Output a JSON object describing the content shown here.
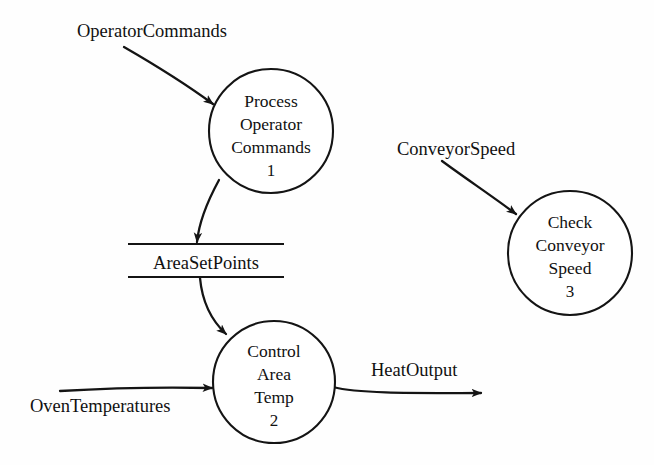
{
  "diagram": {
    "type": "data-flow-diagram",
    "title": "",
    "background_color": "#fefefe",
    "line_color": "#141414",
    "text_color": "#111111",
    "processes": [
      {
        "id": "process-1",
        "number": "1",
        "lines": [
          "Process",
          "Operator",
          "Commands"
        ],
        "cx": 271,
        "cy": 131,
        "r": 62
      },
      {
        "id": "process-2",
        "number": "2",
        "lines": [
          "Control",
          "Area",
          "Temp"
        ],
        "cx": 274,
        "cy": 382,
        "r": 61
      },
      {
        "id": "process-3",
        "number": "3",
        "lines": [
          "Check",
          "Conveyor",
          "Speed"
        ],
        "cx": 570,
        "cy": 253,
        "r": 62
      }
    ],
    "data_stores": [
      {
        "id": "data-store-areasetpoints",
        "label": "AreaSetPoints",
        "x1": 128,
        "x2": 284,
        "y_top": 244,
        "y_bottom": 277,
        "label_x": 206,
        "label_y": 269
      }
    ],
    "flows": [
      {
        "id": "flow-operator-commands",
        "label": "OperatorCommands",
        "label_x": 77,
        "label_y": 37,
        "from": "external",
        "to": "process-1",
        "path": "M 124,47 C 150,62 183,82 213,104"
      },
      {
        "id": "flow-areasetpoints-out",
        "label": "",
        "from": "process-1",
        "to": "data-store-areasetpoints",
        "path": "M 219,180 C 207,202 199,222 197,242"
      },
      {
        "id": "flow-areasetpoints-in",
        "label": "",
        "from": "data-store-areasetpoints",
        "to": "process-2",
        "path": "M 200,278 C 202,300 211,320 226,334"
      },
      {
        "id": "flow-oven-temperatures",
        "label": "OvenTemperatures",
        "label_x": 30,
        "label_y": 412,
        "from": "external",
        "to": "process-2",
        "path": "M 60,391 C 110,388 170,387 212,388"
      },
      {
        "id": "flow-heat-output",
        "label": "HeatOutput",
        "label_x": 371,
        "label_y": 376,
        "from": "process-2",
        "to": "external",
        "path": "M 333,387 C 360,394 420,393 481,393"
      },
      {
        "id": "flow-conveyor-speed",
        "label": "ConveyorSpeed",
        "label_x": 397,
        "label_y": 155,
        "from": "external",
        "to": "process-3",
        "path": "M 442,161 C 465,178 492,196 516,214"
      }
    ]
  }
}
